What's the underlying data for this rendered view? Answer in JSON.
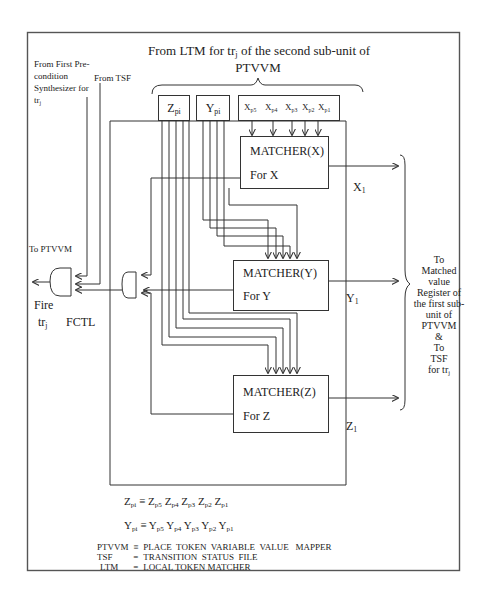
{
  "figure": {
    "title_line1": "From LTM for tr",
    "title_sub": "j",
    "title_line1_rest": " of  the second sub-unit of",
    "title_line2": "PTVVM"
  },
  "left_inputs": {
    "precondition": [
      "From First Pre-",
      "condition",
      "Synthesizer for",
      "tr"
    ],
    "precondition_sub": "j",
    "tsf": "From TSF",
    "to_ptvvm": "To PTVVM"
  },
  "registers": {
    "z": {
      "base": "Z",
      "sub": "pi"
    },
    "y": {
      "base": "Y",
      "sub": "pi"
    },
    "x_bits": [
      {
        "base": "X",
        "sub": "p5"
      },
      {
        "base": "X",
        "sub": "p4"
      },
      {
        "base": "X",
        "sub": "p3"
      },
      {
        "base": "X",
        "sub": "p2"
      },
      {
        "base": "X",
        "sub": "p1"
      }
    ]
  },
  "matchers": [
    {
      "title": "MATCHER(X)",
      "subtitle": "For X",
      "output": {
        "base": "X",
        "sub": "1"
      }
    },
    {
      "title": "MATCHER(Y)",
      "subtitle": "For Y",
      "output": {
        "base": "Y",
        "sub": "1"
      }
    },
    {
      "title": "MATCHER(Z)",
      "subtitle": "For  Z",
      "output": {
        "base": "Z",
        "sub": "1"
      }
    }
  ],
  "fire": {
    "label": "Fire",
    "tr": "tr",
    "tr_sub": "j",
    "fctl": "FCTL"
  },
  "right_output": {
    "lines": [
      "To",
      "Matched",
      "value",
      "Register of",
      "the first sub-",
      "unit of",
      "PTVVM",
      "&",
      "To",
      "TSF"
    ],
    "last": "for tr",
    "last_sub": "j"
  },
  "equations": {
    "z": {
      "lhs": "Z",
      "lhs_sub": "pi",
      "terms": [
        [
          "Z",
          "p5"
        ],
        [
          "Z",
          "p4"
        ],
        [
          "Z",
          "p3"
        ],
        [
          "Z",
          "p2"
        ],
        [
          "Z",
          "p1"
        ]
      ]
    },
    "y": {
      "lhs": "Y",
      "lhs_sub": "pi",
      "terms": [
        [
          "Y",
          "p5"
        ],
        [
          "Y",
          "p4"
        ],
        [
          "Y",
          "p3"
        ],
        [
          "Y",
          "p2"
        ],
        [
          "Y",
          "p1"
        ]
      ]
    },
    "equiv": "≡"
  },
  "legend": [
    {
      "abbr": "PTVVM",
      "eq": "≡",
      "full": "PLACE  TOKEN  VARIABLE  VALUE   MAPPER"
    },
    {
      "abbr": "TSF",
      "eq": "=",
      "full": "TRANSITION  STATUS  FILE"
    },
    {
      "abbr": "LTM",
      "eq": "=",
      "full": "LOCAL TOKEN MATCHER"
    }
  ],
  "colors": {
    "line": "#333333",
    "frame": "#555555",
    "background": "#ffffff"
  }
}
